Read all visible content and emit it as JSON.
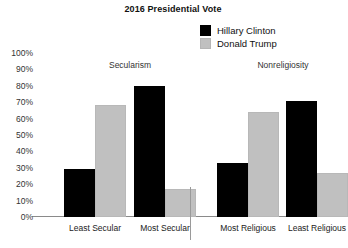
{
  "chart_data": {
    "type": "bar",
    "title": "2016 Presidential Vote",
    "xlabel": "",
    "ylabel": "",
    "ylim": [
      0,
      100
    ],
    "grid": false,
    "legend_position": "top-right",
    "categories": [
      "Least Secular",
      "Most Secular",
      "Most Religious",
      "Least Religious"
    ],
    "series": [
      {
        "name": "Hillary Clinton",
        "color": "#000000",
        "values": [
          29,
          80,
          33,
          71
        ]
      },
      {
        "name": "Donald Trump",
        "color": "#c0c0c0",
        "values": [
          68,
          17,
          64,
          27
        ]
      }
    ],
    "ytick_labels": [
      "100%",
      "90%",
      "80%",
      "70%",
      "60%",
      "50%",
      "40%",
      "30%",
      "20%",
      "10%",
      "0%"
    ],
    "ytick_values": [
      100,
      90,
      80,
      70,
      60,
      50,
      40,
      30,
      20,
      10,
      0
    ],
    "groups": [
      {
        "label": "Secularism",
        "categories": [
          "Least Secular",
          "Most Secular"
        ]
      },
      {
        "label": "Nonreligiosity",
        "categories": [
          "Most Religious",
          "Least Religious"
        ]
      }
    ]
  }
}
